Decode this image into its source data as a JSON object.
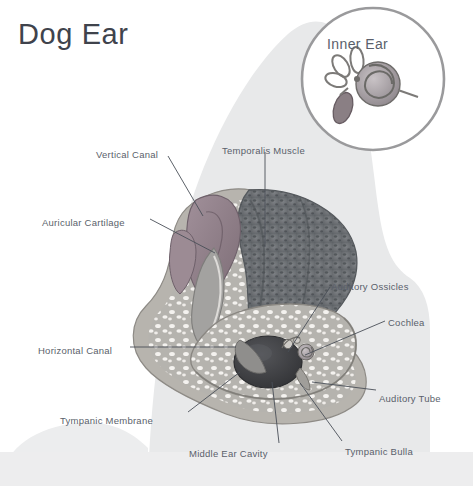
{
  "title": "Dog Ear",
  "inset": {
    "title": "Inner Ear",
    "icons": [
      "cochlea-spiral-icon",
      "semicircular-canals-icon",
      "vestibule-icon"
    ]
  },
  "palette": {
    "background": "#ffffff",
    "silhouette": "#e6e7e8",
    "title_text": "#3f434c",
    "label_text": "#5a5f6b",
    "leader_line": "#4a4f58",
    "muscle_dark": "#6f7377",
    "cartilage": "#8e7d84",
    "bone_speckle": "#f2f0ee",
    "bone_base": "#b9b7b2",
    "canal_gray": "#9a9a99",
    "cavity_dark": "#3e3f42",
    "inset_ring": "#9a9a9c"
  },
  "labels": [
    {
      "id": "vertical-canal",
      "text": "Vertical Canal",
      "x": 96,
      "y": 149,
      "anchor": "start"
    },
    {
      "id": "temporalis-muscle",
      "text": "Temporalis Muscle",
      "x": 222,
      "y": 145,
      "anchor": "start"
    },
    {
      "id": "auricular-cartilage",
      "text": "Auricular Cartilage",
      "x": 42,
      "y": 217,
      "anchor": "start"
    },
    {
      "id": "auditory-ossicles",
      "text": "Auditory Ossicles",
      "x": 331,
      "y": 281,
      "anchor": "start"
    },
    {
      "id": "cochlea",
      "text": "Cochlea",
      "x": 388,
      "y": 317,
      "anchor": "start"
    },
    {
      "id": "horizontal-canal",
      "text": "Horizontal Canal",
      "x": 38,
      "y": 345,
      "anchor": "start"
    },
    {
      "id": "auditory-tube",
      "text": "Auditory Tube",
      "x": 379,
      "y": 393,
      "anchor": "start"
    },
    {
      "id": "tympanic-membrane",
      "text": "Tympanic Membrane",
      "x": 60,
      "y": 415,
      "anchor": "start"
    },
    {
      "id": "middle-ear-cavity",
      "text": "Middle Ear Cavity",
      "x": 189,
      "y": 448,
      "anchor": "start"
    },
    {
      "id": "tympanic-bulla",
      "text": "Tympanic Bulla",
      "x": 345,
      "y": 446,
      "anchor": "start"
    }
  ],
  "leaders": [
    {
      "id": "leader-vertical-canal",
      "d": "M168 156 L203 216"
    },
    {
      "id": "leader-temporalis-muscle",
      "d": "M265 152 L265 247"
    },
    {
      "id": "leader-auricular-cartilage",
      "d": "M150 219 L215 253"
    },
    {
      "id": "leader-auditory-ossicles",
      "d": "M330 287 L288 352"
    },
    {
      "id": "leader-cochlea",
      "d": "M385 321 L305 355"
    },
    {
      "id": "leader-horizontal-canal",
      "d": "M130 347 L236 347"
    },
    {
      "id": "leader-auditory-tube",
      "d": "M376 390 L312 382"
    },
    {
      "id": "leader-tympanic-membrane",
      "d": "M188 412 L240 372"
    },
    {
      "id": "leader-middle-ear-cavity",
      "d": "M279 443 L272 382"
    },
    {
      "id": "leader-tympanic-bulla",
      "d": "M342 441 L300 383"
    }
  ]
}
